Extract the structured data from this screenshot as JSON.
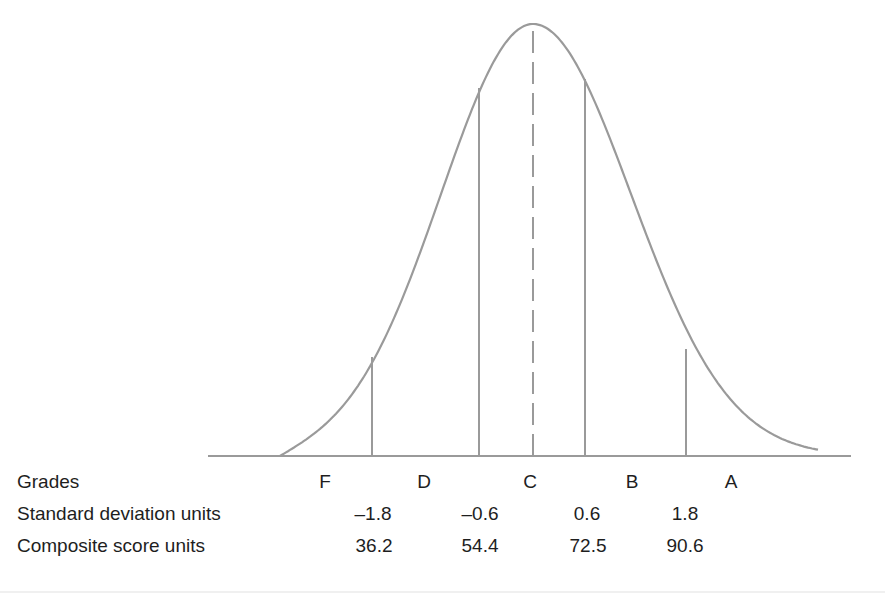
{
  "chart_data": {
    "type": "area",
    "title": "",
    "curve": "normal",
    "mean_line": {
      "style": "dashed",
      "sd": 0,
      "grade": "C"
    },
    "cutoffs": [
      {
        "sd": -1.8,
        "composite": 36.2
      },
      {
        "sd": -0.6,
        "composite": 54.4
      },
      {
        "sd": 0.6,
        "composite": 72.5
      },
      {
        "sd": 1.8,
        "composite": 90.6
      }
    ],
    "grades": [
      "F",
      "D",
      "C",
      "B",
      "A"
    ],
    "rows": [
      {
        "label": "Grades",
        "values": [
          "F",
          "D",
          "C",
          "B",
          "A"
        ]
      },
      {
        "label": "Standard deviation units",
        "values": [
          "–1.8",
          "–0.6",
          "0.6",
          "1.8"
        ]
      },
      {
        "label": "Composite score units",
        "values": [
          "36.2",
          "54.4",
          "72.5",
          "90.6"
        ]
      }
    ],
    "line_color": "#9a9a9a",
    "grid": false
  },
  "table": {
    "grades_label": "Grades",
    "grades": [
      "F",
      "D",
      "C",
      "B",
      "A"
    ],
    "sd_label": "Standard deviation units",
    "sd_values": [
      "–1.8",
      "–0.6",
      "0.6",
      "1.8"
    ],
    "composite_label": "Composite score units",
    "composite_values": [
      "36.2",
      "54.4",
      "72.5",
      "90.6"
    ]
  }
}
